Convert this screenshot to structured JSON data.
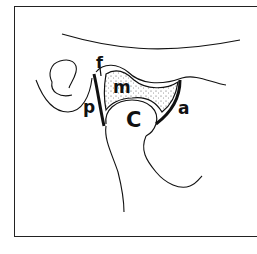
{
  "figure": {
    "type": "anatomical-line-drawing",
    "labels": {
      "f": "f",
      "m": "m",
      "p": "p",
      "c": "C",
      "a": "a"
    },
    "colors": {
      "stroke": "#111111",
      "background": "#ffffff",
      "frame": "#222222"
    }
  }
}
